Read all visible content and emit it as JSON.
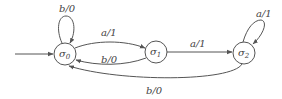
{
  "diagram": {
    "type": "finite-state-machine",
    "start_state": "σ0",
    "states": [
      {
        "id": "s0",
        "label": "σ",
        "sub": "0"
      },
      {
        "id": "s1",
        "label": "σ",
        "sub": "1"
      },
      {
        "id": "s2",
        "label": "σ",
        "sub": "2"
      }
    ],
    "transitions": [
      {
        "from": "σ0",
        "to": "σ0",
        "label": "b/0"
      },
      {
        "from": "σ0",
        "to": "σ1",
        "label": "a/1"
      },
      {
        "from": "σ1",
        "to": "σ0",
        "label": "b/0"
      },
      {
        "from": "σ1",
        "to": "σ2",
        "label": "a/1"
      },
      {
        "from": "σ2",
        "to": "σ2",
        "label": "a/1"
      },
      {
        "from": "σ2",
        "to": "σ0",
        "label": "b/0"
      }
    ]
  }
}
